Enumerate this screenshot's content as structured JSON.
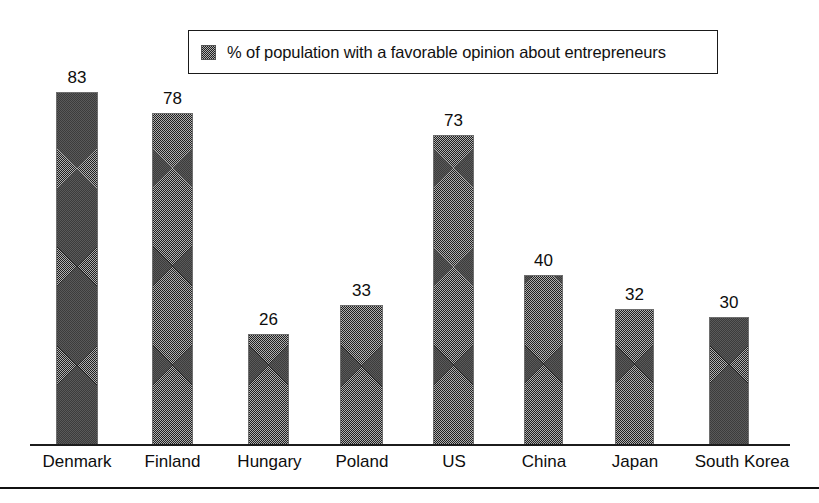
{
  "legend": {
    "label": "% of population with a favorable opinion about entrepreneurs",
    "swatch_name": "legend-swatch-dithered-gray"
  },
  "axis": {
    "baseline_y": 445,
    "bottom_rule_y": 488
  },
  "chart_data": {
    "type": "bar",
    "title": "",
    "subtitle": "",
    "xlabel": "",
    "ylabel": "",
    "categories": [
      "Denmark",
      "Finland",
      "Hungary",
      "Poland",
      "US",
      "China",
      "Japan",
      "South Korea"
    ],
    "values": [
      83,
      78,
      26,
      33,
      73,
      40,
      32,
      30
    ],
    "series": [
      {
        "name": "% of population with a favorable opinion about entrepreneurs",
        "values": [
          83,
          78,
          26,
          33,
          73,
          40,
          32,
          30
        ]
      }
    ],
    "data_labels": [
      "83",
      "78",
      "26",
      "33",
      "73",
      "40",
      "32",
      "30"
    ],
    "ylim": [
      0,
      90
    ],
    "grid": false,
    "y_axis_visible": false,
    "y_tick_labels": [],
    "legend": {
      "position": "top-center",
      "entries": [
        "% of population with a favorable opinion about entrepreneurs"
      ]
    },
    "units": "percent",
    "bar_fill": "dithered-gray",
    "bar_fill_color": "#808080",
    "bar_edge_color": "#6e6e6e"
  },
  "colors": {
    "background": "#ffffff",
    "ink": "#111111",
    "bar_gray": "#808080"
  },
  "bar_geometry": [
    {
      "left": 56,
      "width": 42
    },
    {
      "left": 152,
      "width": 41
    },
    {
      "left": 248,
      "width": 41
    },
    {
      "left": 340,
      "width": 43
    },
    {
      "left": 433,
      "width": 41
    },
    {
      "left": 524,
      "width": 39
    },
    {
      "left": 615,
      "width": 39
    },
    {
      "left": 709,
      "width": 40
    }
  ],
  "label_geometry": [
    {
      "left": 22,
      "width": 110
    },
    {
      "left": 120,
      "width": 105
    },
    {
      "left": 212,
      "width": 115
    },
    {
      "left": 312,
      "width": 100
    },
    {
      "left": 408,
      "width": 92
    },
    {
      "left": 492,
      "width": 104
    },
    {
      "left": 585,
      "width": 100
    },
    {
      "left": 672,
      "width": 140
    }
  ]
}
